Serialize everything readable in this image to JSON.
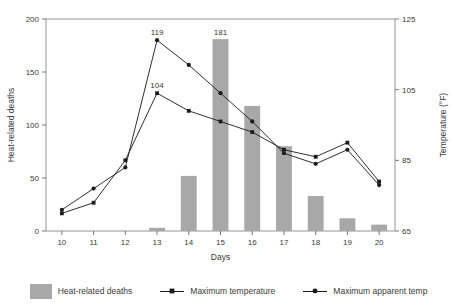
{
  "chart_data": {
    "type": "bar",
    "title": "",
    "xlabel": "Days",
    "ylabel": "Heat-related deaths",
    "y2label": "Temperature (°F)",
    "categories": [
      "10",
      "11",
      "12",
      "13",
      "14",
      "15",
      "16",
      "17",
      "18",
      "19",
      "20"
    ],
    "ylim": [
      0,
      200
    ],
    "yticks": [
      0,
      50,
      100,
      150,
      200
    ],
    "y2lim": [
      65,
      125
    ],
    "y2ticks": [
      65,
      85,
      105,
      125
    ],
    "grid": false,
    "legend_position": "bottom",
    "series": [
      {
        "name": "Heat-related deaths",
        "type": "bar",
        "axis": "left",
        "color": "#a8a8a8",
        "values": [
          0,
          0,
          0,
          3,
          52,
          181,
          118,
          80,
          33,
          12,
          6
        ],
        "point_labels": [
          "",
          "",
          "",
          "",
          "",
          "181",
          "",
          "",
          "",
          "",
          ""
        ]
      },
      {
        "name": "Maximum temperature",
        "type": "line",
        "axis": "right",
        "color": "#1a1a1a",
        "marker": "square",
        "values": [
          70,
          73,
          85,
          104,
          99,
          96,
          93,
          88,
          86,
          90,
          79
        ],
        "point_labels": [
          "",
          "",
          "",
          "104",
          "",
          "",
          "",
          "",
          "",
          "",
          ""
        ]
      },
      {
        "name": "Maximum apparent temp",
        "type": "line",
        "axis": "right",
        "color": "#1a1a1a",
        "marker": "circle",
        "values": [
          71,
          77,
          83,
          119,
          112,
          104,
          96,
          87,
          84,
          88,
          78
        ],
        "point_labels": [
          "",
          "",
          "",
          "119",
          "",
          "",
          "",
          "",
          "",
          "",
          ""
        ]
      }
    ]
  },
  "legend": {
    "items": [
      {
        "label": "Heat-related deaths",
        "kind": "swatch"
      },
      {
        "label": "Maximum temperature",
        "kind": "line-square"
      },
      {
        "label": "Maximum apparent temp",
        "kind": "line-circle"
      }
    ]
  },
  "axes": {
    "left_ticks": [
      "0",
      "50",
      "100",
      "150",
      "200"
    ],
    "right_ticks": [
      "65",
      "85",
      "105",
      "125"
    ],
    "x_ticks": [
      "10",
      "11",
      "12",
      "13",
      "14",
      "15",
      "16",
      "17",
      "18",
      "19",
      "20"
    ],
    "left_title": "Heat-related deaths",
    "right_title": "Temperature (°F)",
    "x_title": "Days"
  },
  "annotations": [
    {
      "text": "119",
      "series": "Maximum apparent temp",
      "x": "13"
    },
    {
      "text": "104",
      "series": "Maximum temperature",
      "x": "13"
    },
    {
      "text": "181",
      "series": "Heat-related deaths",
      "x": "15"
    }
  ]
}
